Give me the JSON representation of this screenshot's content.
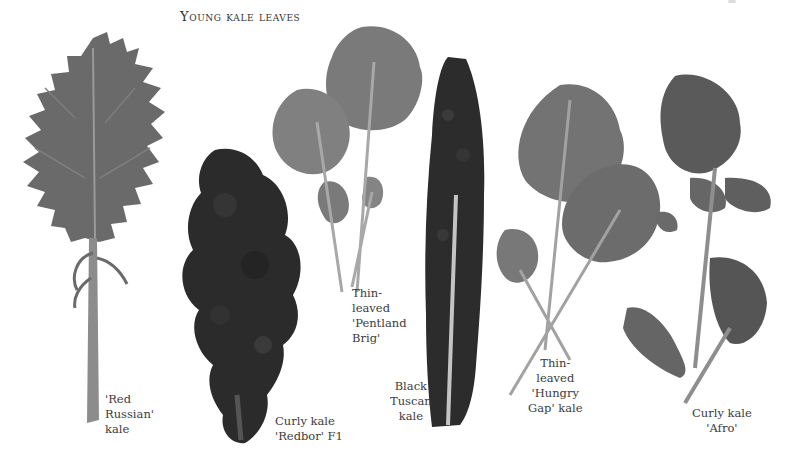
{
  "page": {
    "title": "Young kale leaves"
  },
  "specimens": [
    {
      "name": "Red Russian",
      "caption": "'Red\nRussian'\nkale"
    },
    {
      "name": "Redbor",
      "caption": "Curly kale\n'Redbor' F1"
    },
    {
      "name": "Pentland Brig",
      "caption": "Thin-\nleaved\n'Pentland\nBrig'"
    },
    {
      "name": "Black Tuscan",
      "caption": "Black\nTuscan\nkale"
    },
    {
      "name": "Hungry Gap",
      "caption": "Thin-\nleaved\n'Hungry\nGap' kale"
    },
    {
      "name": "Afro",
      "caption": "Curly kale\n'Afro'"
    }
  ],
  "colors": {
    "background": "#ffffff",
    "leaf_mid": "#6e6e6e",
    "leaf_light": "#8a8a8a",
    "leaf_dark": "#2a2a2a",
    "stem": "#b0b0b0",
    "text": "#3a3a3a"
  }
}
